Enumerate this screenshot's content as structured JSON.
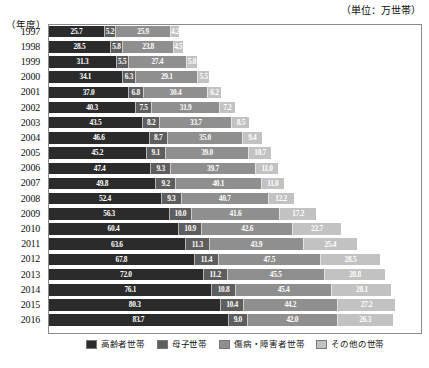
{
  "unit_caption": "（単位：万世帯）",
  "axis_name": "（年度）",
  "legend": {
    "items": [
      {
        "label": "高齢者世帯",
        "color": "#2b2b2b"
      },
      {
        "label": "母子世帯",
        "color": "#5e5e5e"
      },
      {
        "label": "傷病・障害者世帯",
        "color": "#8f8f8f"
      },
      {
        "label": "その他の世帯",
        "color": "#c2c2c2"
      }
    ]
  },
  "chart_data": {
    "type": "bar",
    "orientation": "horizontal",
    "stacked": true,
    "title": "",
    "subtitle": "",
    "xlabel": "",
    "ylabel": "（年度）",
    "unit": "万世帯",
    "grid": false,
    "legend_position": "bottom",
    "xlim": [
      0,
      170
    ],
    "categories": [
      "1997",
      "1998",
      "1999",
      "2000",
      "2001",
      "2002",
      "2003",
      "2004",
      "2005",
      "2006",
      "2007",
      "2008",
      "2009",
      "2010",
      "2011",
      "2012",
      "2013",
      "2014",
      "2015",
      "2016"
    ],
    "series": [
      {
        "name": "高齢者世帯",
        "color": "#2b2b2b",
        "values": [
          25.7,
          28.5,
          31.3,
          34.1,
          37.0,
          40.3,
          43.5,
          46.6,
          45.2,
          47.4,
          49.8,
          52.4,
          56.3,
          60.4,
          63.6,
          67.8,
          72.0,
          76.1,
          80.3,
          83.7
        ]
      },
      {
        "name": "母子世帯",
        "color": "#5e5e5e",
        "values": [
          5.2,
          5.8,
          5.5,
          6.3,
          6.8,
          7.5,
          8.2,
          8.7,
          9.1,
          9.3,
          9.2,
          9.3,
          10.0,
          10.9,
          11.3,
          11.4,
          11.2,
          10.8,
          10.4,
          9.0
        ]
      },
      {
        "name": "傷病・障害者世帯",
        "color": "#8f8f8f",
        "values": [
          25.9,
          23.8,
          27.4,
          29.1,
          30.4,
          31.9,
          33.7,
          35.0,
          39.0,
          39.7,
          40.1,
          40.7,
          41.6,
          42.6,
          43.9,
          47.5,
          45.5,
          45.4,
          44.2,
          42.0
        ]
      },
      {
        "name": "その他の世帯",
        "color": "#c2c2c2",
        "values": [
          4.2,
          4.5,
          5.0,
          5.5,
          6.2,
          7.2,
          8.5,
          9.4,
          10.7,
          11.0,
          11.0,
          12.2,
          17.2,
          22.7,
          25.4,
          28.5,
          28.8,
          28.1,
          27.2,
          26.3
        ]
      }
    ]
  }
}
